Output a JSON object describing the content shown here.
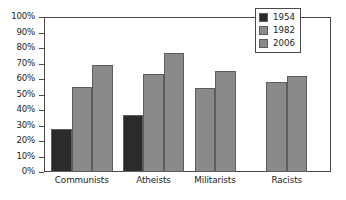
{
  "chart_data": {
    "type": "bar",
    "title": "",
    "xlabel": "",
    "ylabel": "",
    "ylim": [
      0,
      100
    ],
    "ytick_labels": [
      "100%",
      "90%",
      "80%",
      "70%",
      "60%",
      "50%",
      "40%",
      "30%",
      "20%",
      "10%",
      "0%"
    ],
    "ytick_values": [
      100,
      90,
      80,
      70,
      60,
      50,
      40,
      30,
      20,
      10,
      0
    ],
    "grid": false,
    "legend_position": "top-right",
    "categories": [
      "Communists",
      "Atheists",
      "Militarists",
      "Racists"
    ],
    "series": [
      {
        "name": "1954",
        "color": "#2b2b2b",
        "values": [
          28,
          37,
          null,
          null
        ]
      },
      {
        "name": "1982",
        "color": "#8a8a8a",
        "values": [
          55,
          63,
          54,
          58
        ]
      },
      {
        "name": "2006",
        "color": "#8a8a8a",
        "values": [
          69,
          77,
          65,
          62
        ]
      }
    ]
  },
  "axis": {
    "line_color": "#4a4a4a",
    "tick_labels": [
      "100%",
      "90%",
      "80%",
      "70%",
      "60%",
      "50%",
      "40%",
      "30%",
      "20%",
      "10%",
      "0%"
    ]
  },
  "legend": {
    "entries": [
      {
        "label": "1954",
        "color": "#2b2b2b"
      },
      {
        "label": "1982",
        "color": "#8a8a8a"
      },
      {
        "label": "2006",
        "color": "#8a8a8a"
      }
    ]
  }
}
